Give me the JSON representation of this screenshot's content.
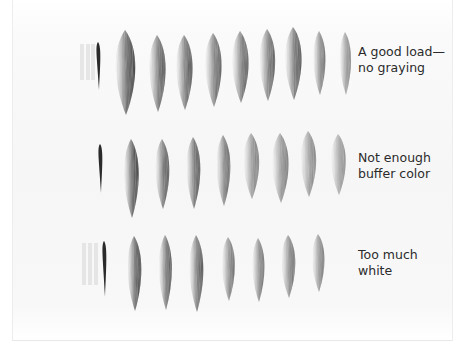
{
  "illustration": {
    "subject": "brush-stroke-load-comparison",
    "stroke_color": "#2a2a2a",
    "rows": [
      {
        "id": "good-load",
        "label_lines": [
          "A good load—",
          "no graying"
        ],
        "label_pos": [
          358,
          44
        ],
        "thin_stroke": {
          "x": 98,
          "top": 42,
          "bottom": 90
        },
        "ghost_x": [
          82,
          88,
          93
        ],
        "strokes": [
          {
            "cx": 125,
            "top": 30,
            "bottom": 115,
            "w": 24,
            "dark": 0.95
          },
          {
            "cx": 157,
            "top": 35,
            "bottom": 112,
            "w": 20,
            "dark": 0.85
          },
          {
            "cx": 184,
            "top": 35,
            "bottom": 110,
            "w": 20,
            "dark": 0.85
          },
          {
            "cx": 213,
            "top": 33,
            "bottom": 107,
            "w": 20,
            "dark": 0.8
          },
          {
            "cx": 240,
            "top": 31,
            "bottom": 103,
            "w": 20,
            "dark": 0.8
          },
          {
            "cx": 267,
            "top": 29,
            "bottom": 101,
            "w": 19,
            "dark": 0.8
          },
          {
            "cx": 293,
            "top": 27,
            "bottom": 100,
            "w": 20,
            "dark": 0.85
          },
          {
            "cx": 319,
            "top": 31,
            "bottom": 95,
            "w": 15,
            "dark": 0.7
          },
          {
            "cx": 345,
            "top": 32,
            "bottom": 95,
            "w": 14,
            "dark": 0.6
          }
        ]
      },
      {
        "id": "not-enough-buffer",
        "label_lines": [
          "Not enough",
          "buffer color"
        ],
        "label_pos": [
          358,
          150
        ],
        "thin_stroke": {
          "x": 100,
          "top": 144,
          "bottom": 193
        },
        "ghost_x": [],
        "strokes": [
          {
            "cx": 131,
            "top": 139,
            "bottom": 218,
            "w": 18,
            "dark": 0.95
          },
          {
            "cx": 162,
            "top": 139,
            "bottom": 209,
            "w": 17,
            "dark": 0.85
          },
          {
            "cx": 193,
            "top": 137,
            "bottom": 209,
            "w": 17,
            "dark": 0.85
          },
          {
            "cx": 223,
            "top": 135,
            "bottom": 206,
            "w": 17,
            "dark": 0.75
          },
          {
            "cx": 251,
            "top": 133,
            "bottom": 199,
            "w": 19,
            "dark": 0.65
          },
          {
            "cx": 280,
            "top": 133,
            "bottom": 203,
            "w": 20,
            "dark": 0.65
          },
          {
            "cx": 308,
            "top": 131,
            "bottom": 197,
            "w": 19,
            "dark": 0.6
          },
          {
            "cx": 338,
            "top": 134,
            "bottom": 195,
            "w": 18,
            "dark": 0.55
          }
        ]
      },
      {
        "id": "too-much-white",
        "label_lines": [
          "Too much",
          "white"
        ],
        "label_pos": [
          358,
          247
        ],
        "thin_stroke": {
          "x": 104,
          "top": 241,
          "bottom": 297
        },
        "ghost_x": [
          84,
          90,
          96
        ],
        "strokes": [
          {
            "cx": 134,
            "top": 236,
            "bottom": 311,
            "w": 17,
            "dark": 0.95
          },
          {
            "cx": 165,
            "top": 235,
            "bottom": 310,
            "w": 16,
            "dark": 0.85
          },
          {
            "cx": 196,
            "top": 235,
            "bottom": 312,
            "w": 17,
            "dark": 0.85
          },
          {
            "cx": 228,
            "top": 237,
            "bottom": 301,
            "w": 16,
            "dark": 0.7
          },
          {
            "cx": 258,
            "top": 238,
            "bottom": 302,
            "w": 15,
            "dark": 0.7
          },
          {
            "cx": 288,
            "top": 235,
            "bottom": 298,
            "w": 17,
            "dark": 0.7
          },
          {
            "cx": 318,
            "top": 234,
            "bottom": 292,
            "w": 15,
            "dark": 0.65
          }
        ]
      }
    ]
  }
}
